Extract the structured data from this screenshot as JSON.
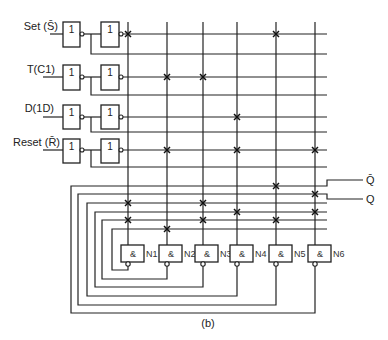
{
  "figure": {
    "caption": "(b)"
  },
  "inputs": [
    {
      "label": "Set (S̄)",
      "gate1": "1",
      "gate2": "1"
    },
    {
      "label": "T(C1)",
      "gate1": "1",
      "gate2": "1"
    },
    {
      "label": "D(1D)",
      "gate1": "1",
      "gate2": "1"
    },
    {
      "label": "Reset (R̄)",
      "gate1": "1",
      "gate2": "1"
    }
  ],
  "and_gates": [
    {
      "name": "N1",
      "symbol": "&",
      "feeds_row": 13
    },
    {
      "name": "N2",
      "symbol": "&",
      "feeds_row": 12
    },
    {
      "name": "N3",
      "symbol": "&",
      "feeds_row": 11
    },
    {
      "name": "N4",
      "symbol": "&",
      "feeds_row": 10
    },
    {
      "name": "N5",
      "symbol": "&",
      "feeds_row": 9
    },
    {
      "name": "N6",
      "symbol": "&",
      "feeds_row": 8
    }
  ],
  "outputs": {
    "q_bar": "Q̄",
    "q": "Q"
  },
  "fuses": [
    {
      "row": 0,
      "col": 0
    },
    {
      "row": 0,
      "col": 4
    },
    {
      "row": 2,
      "col": 1
    },
    {
      "row": 2,
      "col": 2
    },
    {
      "row": 4,
      "col": 3
    },
    {
      "row": 6,
      "col": 1
    },
    {
      "row": 6,
      "col": 3
    },
    {
      "row": 6,
      "col": 5
    },
    {
      "row": 8,
      "col": 4
    },
    {
      "row": 9,
      "col": 5
    },
    {
      "row": 10,
      "col": 0
    },
    {
      "row": 10,
      "col": 2
    },
    {
      "row": 11,
      "col": 3
    },
    {
      "row": 11,
      "col": 5
    },
    {
      "row": 12,
      "col": 0
    },
    {
      "row": 12,
      "col": 2
    },
    {
      "row": 12,
      "col": 4
    },
    {
      "row": 13,
      "col": 1
    }
  ]
}
